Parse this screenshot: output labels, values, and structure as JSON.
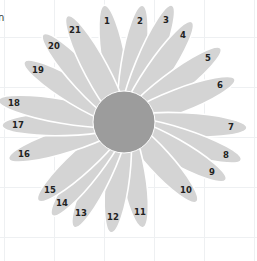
{
  "diagram": {
    "title_fragment": "n",
    "center": {
      "x": 124,
      "y": 122,
      "r": 31
    },
    "colors": {
      "petal": "#d4d4d4",
      "center": "#9c9c9c",
      "label": "#222222",
      "outline": "#ffffff",
      "grid": "#eef0f2"
    },
    "petals": [
      {
        "label": "1",
        "x": 107,
        "y": 21
      },
      {
        "label": "2",
        "x": 140,
        "y": 21
      },
      {
        "label": "3",
        "x": 166,
        "y": 20
      },
      {
        "label": "4",
        "x": 183,
        "y": 35
      },
      {
        "label": "5",
        "x": 208,
        "y": 58
      },
      {
        "label": "6",
        "x": 220,
        "y": 85
      },
      {
        "label": "7",
        "x": 231,
        "y": 127
      },
      {
        "label": "8",
        "x": 226,
        "y": 155
      },
      {
        "label": "9",
        "x": 212,
        "y": 172
      },
      {
        "label": "10",
        "x": 186,
        "y": 190
      },
      {
        "label": "11",
        "x": 140,
        "y": 212
      },
      {
        "label": "12",
        "x": 113,
        "y": 217
      },
      {
        "label": "13",
        "x": 81,
        "y": 213
      },
      {
        "label": "14",
        "x": 62,
        "y": 203
      },
      {
        "label": "15",
        "x": 50,
        "y": 190
      },
      {
        "label": "16",
        "x": 24,
        "y": 154
      },
      {
        "label": "17",
        "x": 18,
        "y": 125
      },
      {
        "label": "18",
        "x": 14,
        "y": 103
      },
      {
        "label": "19",
        "x": 38,
        "y": 70
      },
      {
        "label": "20",
        "x": 54,
        "y": 46
      },
      {
        "label": "21",
        "x": 75,
        "y": 30
      }
    ]
  }
}
